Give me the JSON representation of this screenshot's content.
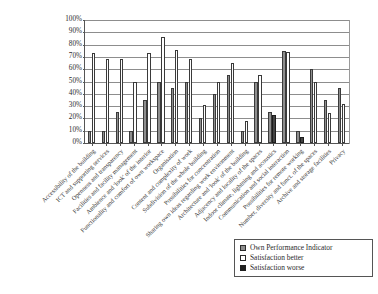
{
  "chart_data": {
    "type": "bar",
    "title": "",
    "subtitle": "",
    "xlabel": "",
    "ylabel": "",
    "ylim": [
      0,
      100
    ],
    "ytick_labels": [
      "0%",
      "10%",
      "20%",
      "30%",
      "40%",
      "50%",
      "60%",
      "70%",
      "80%",
      "90%",
      "100%"
    ],
    "ytick_values": [
      0,
      10,
      20,
      30,
      40,
      50,
      60,
      70,
      80,
      90,
      100
    ],
    "grid": "horizontal",
    "legend_position": "bottom-right",
    "categories": [
      "Accessibility of the building",
      "ICT and supporting services",
      "Openness and transparency",
      "Facilities and facility management",
      "Ambience and 'look' of the interior",
      "Functionality and comfort of own workspace",
      "Organisation",
      "Content and complexity of work",
      "Subdivision of the whole building",
      "Possibilities for concentration",
      "Sharing own ideas regarding work environment",
      "Architecture and 'look' of the building",
      "Adjacency and locality of the spaces",
      "Indoor climate, lightning and acoustics",
      "Communication and social interaction",
      "Possibilities for remote working",
      "Number, diversity and funct. of the spaces",
      "Archive and storage facilities",
      "Privacy"
    ],
    "series": [
      {
        "name": "Own Performance Indicator",
        "color": "#8e8e8e",
        "values": [
          10,
          10,
          25,
          10,
          35,
          50,
          45,
          50,
          20,
          40,
          55,
          10,
          50,
          25,
          75,
          10,
          60,
          35,
          45
        ]
      },
      {
        "name": "Satisfaction better",
        "color": "#ffffff",
        "values": [
          73,
          68,
          68,
          50,
          73,
          86,
          76,
          68,
          31,
          50,
          65,
          18,
          55,
          0,
          74,
          0,
          50,
          24,
          32
        ]
      },
      {
        "name": "Satisfaction worse",
        "color": "#434343",
        "values": [
          0,
          0,
          0,
          0,
          0,
          0,
          0,
          0,
          0,
          0,
          0,
          0,
          0,
          23,
          0,
          5,
          0,
          0,
          0
        ]
      }
    ]
  },
  "legend": {
    "items": [
      {
        "label": "Own Performance Indicator",
        "swatch": "own"
      },
      {
        "label": "Satisfaction better",
        "swatch": "better"
      },
      {
        "label": "Satisfaction worse",
        "swatch": "worse"
      }
    ]
  }
}
